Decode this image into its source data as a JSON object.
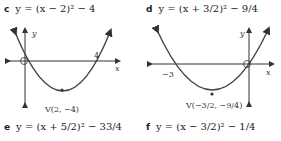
{
  "problems": [
    {
      "label": "c",
      "equation": "y = (x − 2)² − 4",
      "vertex": "V(2, −4)",
      "x_intercept_label": "4",
      "axis_x": "x",
      "axis_y": "y"
    },
    {
      "label": "d",
      "equation": "y = (x + 3/2)² − 9/4",
      "vertex": "V(−3/2, −9/4)",
      "x_intercept_label": "−3",
      "axis_x": "x",
      "axis_y": "y"
    },
    {
      "label": "e",
      "equation": "y = (x + 5/2)² − 33/4"
    },
    {
      "label": "f",
      "equation": "y = (x − 3/2)² − 1/4"
    }
  ]
}
